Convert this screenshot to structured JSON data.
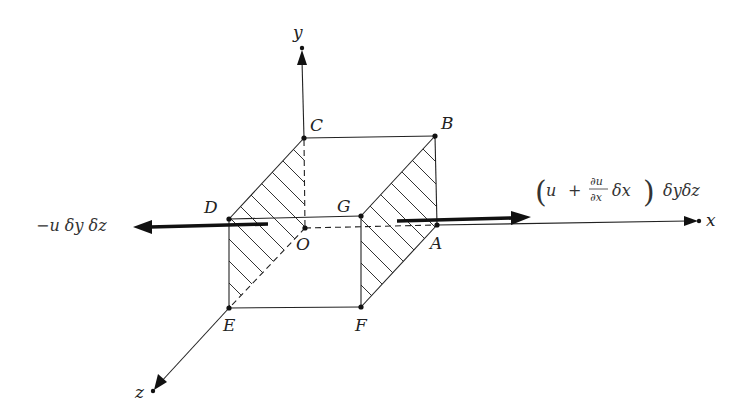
{
  "figure": {
    "axes": {
      "x": {
        "label": "x"
      },
      "y": {
        "label": "y"
      },
      "z": {
        "label": "z"
      }
    },
    "vertices": {
      "A": "A",
      "B": "B",
      "C": "C",
      "D": "D",
      "E": "E",
      "F": "F",
      "G": "G",
      "O": "O"
    },
    "fluxes": {
      "left": {
        "label": "−u δy δz",
        "direction": "negative x"
      },
      "right": {
        "open": "(",
        "u": "u",
        "plus": "+",
        "num": "∂u",
        "den": "∂x",
        "dx": "δx",
        "close": ")",
        "tail": "δyδz",
        "direction": "positive x"
      }
    },
    "colors": {
      "stroke": "#222222",
      "background": "#ffffff"
    }
  }
}
